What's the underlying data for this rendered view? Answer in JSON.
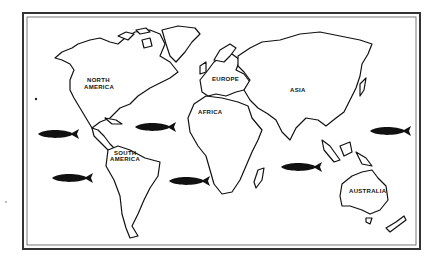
{
  "map": {
    "title": "World map with continents and fish in the oceans",
    "colors": {
      "ink": "#111111",
      "land": "#ffffff",
      "frame": "#333333"
    },
    "continent_labels": {
      "north_america": [
        "NORTH",
        "AMERICA"
      ],
      "south_america": [
        "SOUTH",
        "AMERICA"
      ],
      "europe": "EUROPE",
      "africa": "AFRICA",
      "asia": "ASIA",
      "australia": "AUSTRALIA"
    },
    "fish_count": 6,
    "fish_icon": "fish-silhouette"
  }
}
